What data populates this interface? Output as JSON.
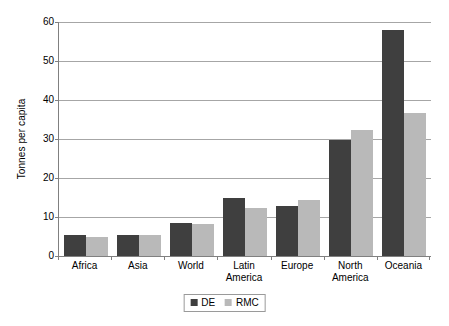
{
  "chart_data": {
    "type": "bar",
    "title": "",
    "xlabel": "",
    "ylabel": "Tonnes per capita",
    "ylim": [
      0,
      60
    ],
    "yticks": [
      0,
      10,
      20,
      30,
      40,
      50,
      60
    ],
    "ytick_labels": [
      "0",
      "10",
      "20",
      "30",
      "40",
      "50",
      "60"
    ],
    "grid": true,
    "legend_position": "bottom-center",
    "categories": [
      "Africa",
      "Asia",
      "World",
      "Latin America",
      "Europe",
      "North America",
      "Oceania"
    ],
    "category_lines": [
      [
        "Africa"
      ],
      [
        "Asia"
      ],
      [
        "World"
      ],
      [
        "Latin",
        "America"
      ],
      [
        "Europe"
      ],
      [
        "North",
        "America"
      ],
      [
        "Oceania"
      ]
    ],
    "series": [
      {
        "name": "DE",
        "color": "#3f3f3f",
        "values": [
          5.4,
          5.4,
          8.5,
          15.0,
          12.8,
          29.8,
          58.0
        ]
      },
      {
        "name": "RMC",
        "color": "#b9b9b9",
        "values": [
          4.8,
          5.4,
          8.3,
          12.3,
          14.3,
          32.2,
          36.7
        ]
      }
    ]
  },
  "legend": {
    "items": [
      {
        "label": "DE",
        "swatch": "dark-square-swatch"
      },
      {
        "label": "RMC",
        "swatch": "light-square-swatch"
      }
    ]
  }
}
